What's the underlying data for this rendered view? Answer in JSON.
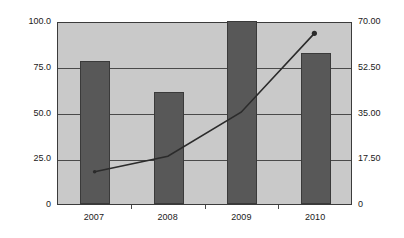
{
  "chart_data": {
    "type": "bar",
    "title": "",
    "subtitle": "",
    "xlabel": "",
    "ylabel": "",
    "categories": [
      "2007",
      "2008",
      "2009",
      "2010"
    ],
    "grid": true,
    "legend": "none",
    "series": [
      {
        "name": "bars",
        "type": "bar",
        "axis": "left",
        "color": "#585858",
        "values": [
          78.0,
          61.0,
          100.0,
          82.5
        ]
      },
      {
        "name": "line",
        "type": "line",
        "axis": "right",
        "color": "#2b2b2b",
        "values": [
          12.5,
          18.5,
          35.5,
          66.0
        ]
      }
    ],
    "axes": {
      "left": {
        "ticks": [
          "0",
          "25.0",
          "50.0",
          "75.0",
          "100.0"
        ],
        "values": [
          0,
          25,
          50,
          75,
          100
        ],
        "ylim": [
          0,
          100
        ]
      },
      "right": {
        "ticks": [
          "0",
          "17.50",
          "35.00",
          "52.50",
          "70.00"
        ],
        "values": [
          0,
          17.5,
          35,
          52.5,
          70
        ],
        "ylim": [
          0,
          70
        ]
      }
    },
    "colors": {
      "bar_fill": "#585858",
      "bar_border": "#3a3a3a",
      "plot_background": "#c9c9c9",
      "plot_border": "#3b3b3b",
      "gridline": "#4a4a4a",
      "line": "#2b2b2b",
      "text": "#1a1a1a",
      "page_background": "#ffffff"
    }
  }
}
